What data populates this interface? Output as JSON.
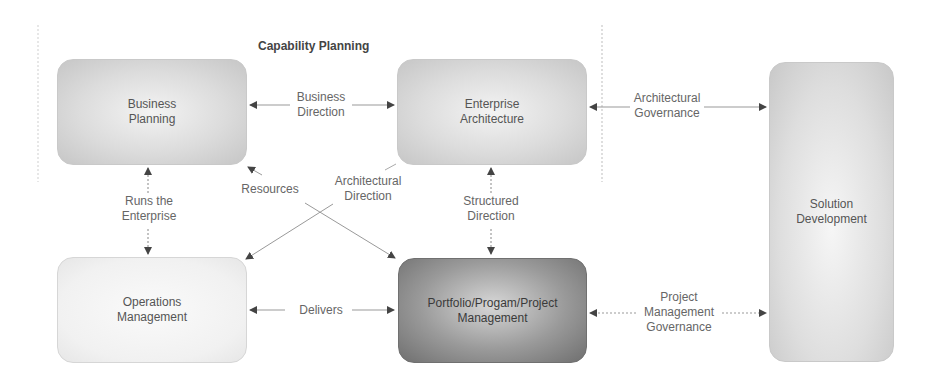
{
  "diagram": {
    "title": "Capability Planning",
    "nodes": {
      "business_planning": "Business\nPlanning",
      "enterprise_architecture": "Enterprise\nArchitecture",
      "operations_management": "Operations\nManagement",
      "portfolio_management": "Portfolio/Progam/Project\nManagement",
      "solution_development": "Solution\nDevelopment"
    },
    "edges": {
      "business_direction": "Business\nDirection",
      "architectural_governance": "Architectural\nGovernance",
      "runs_the_enterprise": "Runs the\nEnterprise",
      "resources": "Resources",
      "architectural_direction": "Architectural\nDirection",
      "structured_direction": "Structured\nDirection",
      "delivers": "Delivers",
      "project_management_governance": "Project\nManagement\nGovernance"
    }
  }
}
